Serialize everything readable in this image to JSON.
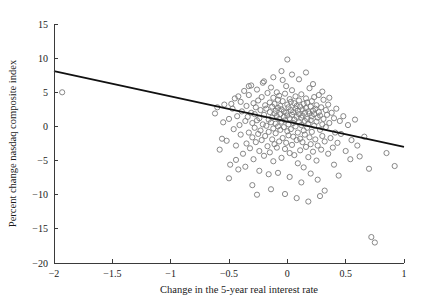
{
  "chart_data": {
    "type": "scatter",
    "title": "",
    "xlabel": "Change in the 5-year real interest rate",
    "ylabel": "Percent change nasdaq composite index",
    "xlim": [
      -2,
      1
    ],
    "ylim": [
      -20,
      15
    ],
    "xticks": [
      -2,
      -1.5,
      -1,
      -0.5,
      0,
      0.5,
      1
    ],
    "xtick_labels": [
      "−2",
      "−1.5",
      "−1",
      "−0.5",
      "0",
      "0.5",
      "1"
    ],
    "yticks": [
      -20,
      -15,
      -10,
      -5,
      0,
      5,
      10,
      15
    ],
    "ytick_labels": [
      "−20",
      "−15",
      "−10",
      "−5",
      "0",
      "5",
      "10",
      "15"
    ],
    "grid": false,
    "legend": false,
    "marker_style": "open-circle",
    "marker_color": "#7a7a7a",
    "marker_radius_px": 2.6,
    "fit_line": {
      "type": "linear-regression",
      "color": "#111111",
      "x_start": -2,
      "y_start": 8.1,
      "x_end": 1,
      "y_end": -3.0,
      "slope": -3.7,
      "intercept": 0.7
    },
    "series": [
      {
        "name": "observations",
        "points": [
          [
            -1.93,
            5.0
          ],
          [
            -0.62,
            1.9
          ],
          [
            -0.58,
            -3.4
          ],
          [
            -0.55,
            0.6
          ],
          [
            -0.54,
            3.2
          ],
          [
            -0.52,
            -2.1
          ],
          [
            -0.5,
            1.1
          ],
          [
            -0.49,
            -5.6
          ],
          [
            -0.47,
            2.6
          ],
          [
            -0.46,
            -0.4
          ],
          [
            -0.45,
            4.1
          ],
          [
            -0.44,
            -2.8
          ],
          [
            -0.43,
            1.5
          ],
          [
            -0.42,
            -6.3
          ],
          [
            -0.41,
            0.2
          ],
          [
            -0.4,
            3.6
          ],
          [
            -0.4,
            -1.2
          ],
          [
            -0.39,
            2.2
          ],
          [
            -0.38,
            -4.0
          ],
          [
            -0.37,
            5.2
          ],
          [
            -0.36,
            0.8
          ],
          [
            -0.35,
            -2.5
          ],
          [
            -0.35,
            3.0
          ],
          [
            -0.34,
            1.4
          ],
          [
            -0.33,
            -0.9
          ],
          [
            -0.33,
            4.6
          ],
          [
            -0.32,
            -3.2
          ],
          [
            -0.31,
            2.0
          ],
          [
            -0.31,
            6.0
          ],
          [
            -0.3,
            -1.6
          ],
          [
            -0.3,
            0.5
          ],
          [
            -0.29,
            3.4
          ],
          [
            -0.29,
            -4.8
          ],
          [
            -0.28,
            1.8
          ],
          [
            -0.28,
            -0.2
          ],
          [
            -0.27,
            2.8
          ],
          [
            -0.27,
            -2.3
          ],
          [
            -0.26,
            5.4
          ],
          [
            -0.26,
            0.9
          ],
          [
            -0.25,
            -1.1
          ],
          [
            -0.25,
            3.8
          ],
          [
            -0.24,
            -3.6
          ],
          [
            -0.24,
            1.2
          ],
          [
            -0.23,
            2.4
          ],
          [
            -0.23,
            -0.6
          ],
          [
            -0.22,
            4.3
          ],
          [
            -0.22,
            -2.0
          ],
          [
            -0.21,
            0.3
          ],
          [
            -0.21,
            6.4
          ],
          [
            -0.2,
            1.7
          ],
          [
            -0.2,
            -4.3
          ],
          [
            -0.19,
            3.1
          ],
          [
            -0.19,
            -1.4
          ],
          [
            -0.18,
            2.6
          ],
          [
            -0.18,
            0.1
          ],
          [
            -0.17,
            -2.9
          ],
          [
            -0.17,
            4.9
          ],
          [
            -0.16,
            1.0
          ],
          [
            -0.16,
            -0.8
          ],
          [
            -0.15,
            3.5
          ],
          [
            -0.15,
            2.1
          ],
          [
            -0.15,
            -3.8
          ],
          [
            -0.14,
            0.6
          ],
          [
            -0.14,
            5.7
          ],
          [
            -0.13,
            -1.9
          ],
          [
            -0.13,
            2.9
          ],
          [
            -0.13,
            1.3
          ],
          [
            -0.12,
            -0.3
          ],
          [
            -0.12,
            4.2
          ],
          [
            -0.12,
            -5.1
          ],
          [
            -0.11,
            1.9
          ],
          [
            -0.11,
            3.3
          ],
          [
            -0.11,
            -2.6
          ],
          [
            -0.1,
            0.4
          ],
          [
            -0.1,
            2.3
          ],
          [
            -0.1,
            -1.0
          ],
          [
            -0.09,
            5.0
          ],
          [
            -0.09,
            1.5
          ],
          [
            -0.09,
            -3.1
          ],
          [
            -0.08,
            3.9
          ],
          [
            -0.08,
            0.0
          ],
          [
            -0.08,
            2.7
          ],
          [
            -0.07,
            -2.2
          ],
          [
            -0.07,
            1.1
          ],
          [
            -0.07,
            4.5
          ],
          [
            -0.06,
            -0.5
          ],
          [
            -0.06,
            3.0
          ],
          [
            -0.06,
            1.8
          ],
          [
            -0.05,
            -4.6
          ],
          [
            -0.05,
            2.5
          ],
          [
            -0.05,
            0.7
          ],
          [
            -0.04,
            6.8
          ],
          [
            -0.04,
            -1.7
          ],
          [
            -0.04,
            3.7
          ],
          [
            -0.03,
            1.4
          ],
          [
            -0.03,
            -0.1
          ],
          [
            -0.03,
            2.2
          ],
          [
            -0.02,
            -3.3
          ],
          [
            -0.02,
            4.8
          ],
          [
            -0.02,
            0.9
          ],
          [
            -0.01,
            2.0
          ],
          [
            -0.01,
            -2.4
          ],
          [
            -0.01,
            5.9
          ],
          [
            0.0,
            1.6
          ],
          [
            0.0,
            -0.7
          ],
          [
            0.0,
            3.2
          ],
          [
            0.0,
            9.8
          ],
          [
            0.01,
            2.8
          ],
          [
            0.01,
            -1.3
          ],
          [
            0.01,
            0.3
          ],
          [
            0.02,
            4.0
          ],
          [
            0.02,
            1.2
          ],
          [
            0.02,
            -3.9
          ],
          [
            0.03,
            2.4
          ],
          [
            0.03,
            -0.4
          ],
          [
            0.03,
            3.6
          ],
          [
            0.04,
            1.7
          ],
          [
            0.04,
            -2.7
          ],
          [
            0.04,
            5.3
          ],
          [
            0.05,
            0.5
          ],
          [
            0.05,
            2.1
          ],
          [
            0.05,
            -1.5
          ],
          [
            0.06,
            3.4
          ],
          [
            0.06,
            -4.2
          ],
          [
            0.06,
            1.0
          ],
          [
            0.07,
            2.6
          ],
          [
            0.07,
            0.0
          ],
          [
            0.07,
            4.4
          ],
          [
            0.08,
            -2.0
          ],
          [
            0.08,
            1.4
          ],
          [
            0.08,
            3.0
          ],
          [
            0.09,
            -0.9
          ],
          [
            0.09,
            2.3
          ],
          [
            0.09,
            -5.4
          ],
          [
            0.1,
            1.8
          ],
          [
            0.1,
            0.6
          ],
          [
            0.1,
            3.8
          ],
          [
            0.11,
            -1.8
          ],
          [
            0.11,
            2.9
          ],
          [
            0.11,
            -3.5
          ],
          [
            0.12,
            1.3
          ],
          [
            0.12,
            4.7
          ],
          [
            0.12,
            0.2
          ],
          [
            0.13,
            2.5
          ],
          [
            0.13,
            -2.3
          ],
          [
            0.13,
            1.6
          ],
          [
            0.14,
            3.3
          ],
          [
            0.14,
            -0.6
          ],
          [
            0.14,
            -6.0
          ],
          [
            0.15,
            2.0
          ],
          [
            0.15,
            0.8
          ],
          [
            0.15,
            -1.2
          ],
          [
            0.16,
            4.1
          ],
          [
            0.16,
            2.7
          ],
          [
            0.16,
            -3.0
          ],
          [
            0.17,
            1.1
          ],
          [
            0.17,
            -0.2
          ],
          [
            0.17,
            3.5
          ],
          [
            0.18,
            -4.5
          ],
          [
            0.18,
            2.2
          ],
          [
            0.18,
            0.4
          ],
          [
            0.19,
            1.9
          ],
          [
            0.19,
            -1.6
          ],
          [
            0.19,
            5.6
          ],
          [
            0.2,
            2.9
          ],
          [
            0.2,
            -2.6
          ],
          [
            0.2,
            0.9
          ],
          [
            0.21,
            3.7
          ],
          [
            0.21,
            1.5
          ],
          [
            0.21,
            -0.8
          ],
          [
            0.22,
            2.3
          ],
          [
            0.22,
            -3.7
          ],
          [
            0.23,
            4.3
          ],
          [
            0.23,
            0.1
          ],
          [
            0.23,
            1.8
          ],
          [
            0.24,
            -1.9
          ],
          [
            0.24,
            2.6
          ],
          [
            0.25,
            -5.0
          ],
          [
            0.25,
            3.1
          ],
          [
            0.25,
            0.7
          ],
          [
            0.26,
            1.3
          ],
          [
            0.26,
            -2.8
          ],
          [
            0.27,
            2.1
          ],
          [
            0.27,
            4.6
          ],
          [
            0.28,
            -0.5
          ],
          [
            0.28,
            1.6
          ],
          [
            0.29,
            -3.4
          ],
          [
            0.29,
            2.8
          ],
          [
            0.3,
            0.3
          ],
          [
            0.3,
            -1.4
          ],
          [
            0.31,
            3.9
          ],
          [
            0.31,
            1.1
          ],
          [
            0.32,
            -2.2
          ],
          [
            0.33,
            2.4
          ],
          [
            0.33,
            -0.1
          ],
          [
            0.34,
            1.7
          ],
          [
            0.35,
            -4.0
          ],
          [
            0.35,
            3.2
          ],
          [
            0.36,
            0.5
          ],
          [
            0.37,
            -1.7
          ],
          [
            0.38,
            2.0
          ],
          [
            0.39,
            -3.1
          ],
          [
            0.4,
            1.2
          ],
          [
            0.41,
            -0.9
          ],
          [
            0.42,
            2.6
          ],
          [
            0.43,
            -2.4
          ],
          [
            0.45,
            0.8
          ],
          [
            0.46,
            -1.1
          ],
          [
            0.48,
            1.5
          ],
          [
            0.5,
            -3.6
          ],
          [
            0.52,
            0.2
          ],
          [
            0.55,
            -2.0
          ],
          [
            0.58,
            1.0
          ],
          [
            0.62,
            -4.4
          ],
          [
            0.66,
            -1.5
          ],
          [
            0.7,
            -6.2
          ],
          [
            -0.12,
            7.2
          ],
          [
            -0.05,
            8.1
          ],
          [
            0.04,
            7.6
          ],
          [
            0.1,
            6.9
          ],
          [
            -0.2,
            6.6
          ],
          [
            0.16,
            7.9
          ],
          [
            -0.33,
            5.9
          ],
          [
            0.22,
            6.2
          ],
          [
            -0.42,
            4.4
          ],
          [
            0.3,
            5.1
          ],
          [
            -0.48,
            3.3
          ],
          [
            0.36,
            4.2
          ],
          [
            -0.08,
            -6.8
          ],
          [
            0.02,
            -7.4
          ],
          [
            -0.16,
            -7.0
          ],
          [
            0.12,
            -8.2
          ],
          [
            -0.24,
            -6.5
          ],
          [
            0.2,
            -6.9
          ],
          [
            -0.3,
            -8.6
          ],
          [
            0.26,
            -7.8
          ],
          [
            -0.36,
            -5.9
          ],
          [
            0.32,
            -9.4
          ],
          [
            -0.44,
            -4.9
          ],
          [
            0.4,
            -5.6
          ],
          [
            -0.02,
            -9.9
          ],
          [
            0.08,
            -10.5
          ],
          [
            -0.14,
            -9.2
          ],
          [
            0.18,
            -11.0
          ],
          [
            0.28,
            -10.2
          ],
          [
            -0.26,
            -10.0
          ],
          [
            0.44,
            -7.2
          ],
          [
            -0.5,
            -7.6
          ],
          [
            0.54,
            -4.8
          ],
          [
            -0.56,
            -1.8
          ],
          [
            0.6,
            -2.8
          ],
          [
            -0.6,
            2.8
          ],
          [
            0.72,
            -16.2
          ],
          [
            0.75,
            -17.0
          ],
          [
            0.85,
            -3.9
          ],
          [
            0.92,
            -5.8
          ]
        ]
      }
    ]
  },
  "axes": {
    "x_title": "Change in the 5-year real interest rate",
    "y_title": "Percent change nasdaq composite index"
  }
}
